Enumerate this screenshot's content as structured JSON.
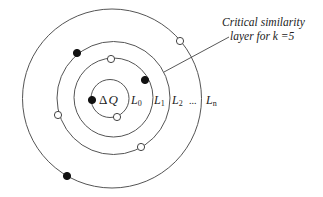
{
  "diagram": {
    "type": "concentric-similarity-layers",
    "center_label_delta": "Δ",
    "center_label_q": "Q",
    "layers": [
      {
        "id": "L0",
        "label": "L",
        "sub": "0",
        "cx": 110,
        "cy": 98.5,
        "r": 19
      },
      {
        "id": "L1",
        "label": "L",
        "sub": "1",
        "cx": 113.5,
        "cy": 97.5,
        "r": 39.5
      },
      {
        "id": "L2",
        "label": "L",
        "sub": "2",
        "cx": 113.5,
        "cy": 98,
        "r": 56.5
      },
      {
        "id": "Ln",
        "label": "L",
        "sub": "n",
        "cx": 112,
        "cy": 98.5,
        "r": 89.5
      }
    ],
    "ellipsis": "...",
    "annotation": {
      "line1": "Critical similarity",
      "line2": "layer for k =5",
      "points_to": "L2"
    },
    "points": [
      {
        "layer": "L0",
        "x": 92,
        "y": 100,
        "filled": true
      },
      {
        "layer": "L0",
        "x": 117,
        "y": 117,
        "filled": false
      },
      {
        "layer": "L1",
        "x": 111,
        "y": 59,
        "filled": false
      },
      {
        "layer": "L1",
        "x": 145,
        "y": 80,
        "filled": true
      },
      {
        "layer": "L2",
        "x": 77,
        "y": 53,
        "filled": true
      },
      {
        "layer": "L2",
        "x": 58,
        "y": 115,
        "filled": false
      },
      {
        "layer": "L2",
        "x": 141,
        "y": 147,
        "filled": false
      },
      {
        "layer": "Ln",
        "x": 180,
        "y": 41,
        "filled": false
      },
      {
        "layer": "Ln",
        "x": 67,
        "y": 176,
        "filled": true
      }
    ]
  }
}
